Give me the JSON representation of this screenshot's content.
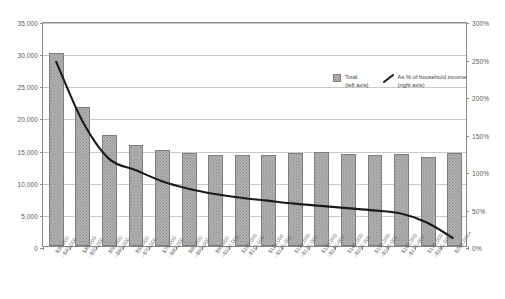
{
  "title": "",
  "legend": {
    "position": "inside-top-right",
    "items": [
      {
        "name": "total-legend",
        "label_line1": "Total",
        "label_line2": "(left axis)",
        "marker": "bar-swatch-icon"
      },
      {
        "name": "percent-legend",
        "label_line1": "As % of household income",
        "label_line2": "(right axis)",
        "marker": "line-swatch-icon"
      }
    ]
  },
  "axes": {
    "left": {
      "ticks": [
        "0",
        "5,000",
        "10,000",
        "15,000",
        "20,000",
        "25,000",
        "30,000",
        "35,000"
      ],
      "min": 0,
      "max": 35000,
      "step": 5000
    },
    "right": {
      "ticks": [
        "0%",
        "50%",
        "100%",
        "150%",
        "200%",
        "250%",
        "300%"
      ],
      "min": 0,
      "max": 300,
      "step": 50
    }
  },
  "colors": {
    "bar_fill": "#b0b0b0",
    "bar_border": "#7d7d7d",
    "line": "#1a1a1a",
    "grid": "#c9c9c9",
    "frame": "#8a8a8a",
    "text": "#5a5a5a"
  },
  "chart_data": {
    "type": "bar",
    "title": "",
    "xlabel": "",
    "ylabel": "",
    "ylim": [
      0,
      35000
    ],
    "y2lim": [
      0,
      300
    ],
    "grid": true,
    "legend_position": "inside-top-right",
    "categories": [
      "$30,000\n–$40,000",
      "$40,000\n–$50,000",
      "$50,000\n–$60,000",
      "$60,000\n–$70,000",
      "$70,000\n–$80,000",
      "$80,000\n–$90,000",
      "$90,000\n–$100,000",
      "$100,000\n–$110,000",
      "$110,000\n–$120,000",
      "$120,000\n–$130,000",
      "$130,000\n–$140,000",
      "$140,000\n–$150,000",
      "$150,000\n–$160,000",
      "$160,000\n–$170,000",
      "$170,000\n–$180,000",
      "$200,000+"
    ],
    "category_labels": [
      [
        "$30,000",
        "–$40,000"
      ],
      [
        "$40,000",
        "–$50,000"
      ],
      [
        "$50,000",
        "–$60,000"
      ],
      [
        "$60,000",
        "–$70,000"
      ],
      [
        "$70,000",
        "–$80,000"
      ],
      [
        "$80,000",
        "–$90,000"
      ],
      [
        "$90,000",
        "–$100,000"
      ],
      [
        "$100,000",
        "–$110,000"
      ],
      [
        "$110,000",
        "–$120,000"
      ],
      [
        "$120,000",
        "–$130,000"
      ],
      [
        "$130,000",
        "–$140,000"
      ],
      [
        "$140,000",
        "–$150,000"
      ],
      [
        "$150,000",
        "–$160,000"
      ],
      [
        "$160,000",
        "–$170,000"
      ],
      [
        "$170,000",
        "–$180,000"
      ],
      [
        "$200,000+",
        ""
      ]
    ],
    "series": [
      {
        "name": "Total",
        "type": "bar",
        "axis": "left",
        "values": [
          30000,
          21700,
          17300,
          15700,
          14900,
          14500,
          14200,
          14200,
          14200,
          14400,
          14600,
          14300,
          14200,
          14300,
          13900,
          14500
        ]
      },
      {
        "name": "As % of household income",
        "type": "line",
        "axis": "right",
        "values": [
          248,
          168,
          118,
          103,
          88,
          78,
          71,
          66,
          62,
          58,
          55,
          52,
          49,
          45,
          33,
          12
        ]
      }
    ]
  }
}
